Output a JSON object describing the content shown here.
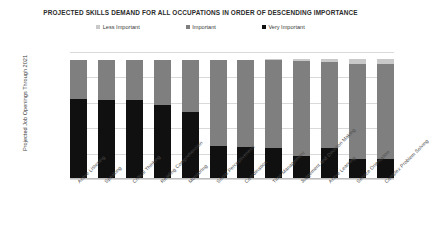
{
  "chart_data": {
    "type": "bar",
    "subtype": "stacked-column",
    "title": "PROJECTED SKILLS DEMAND FOR ALL OCCUPATIONS IN ORDER OF DESCENDING IMPORTANCE",
    "xlabel": "",
    "ylabel": "Projected Job Openings Through 2021",
    "ylim": [
      0,
      2500000
    ],
    "ytick_labels": [
      "2,500,000",
      "2,000,000",
      "1,500,000",
      "1,000,000",
      "500,000",
      "0"
    ],
    "ytick_values": [
      2500000,
      2000000,
      1500000,
      1000000,
      500000,
      0
    ],
    "grid": true,
    "legend_position": "top-center",
    "categories": [
      "Active Listening",
      "Speaking",
      "Critical Thinking",
      "Reading Comprehension",
      "Monitoring",
      "Social Perceptiveness",
      "Coordination",
      "Time Management",
      "Judgement and Decision Making",
      "Active Learning",
      "Service Orientation",
      "Complex Problem Solving"
    ],
    "series": [
      {
        "name": "Very Important",
        "color": "#101010",
        "values": [
          1570000,
          1560000,
          1550000,
          1450000,
          1310000,
          650000,
          640000,
          620000,
          460000,
          610000,
          390000,
          400000
        ]
      },
      {
        "name": "Important",
        "color": "#7f7f7f",
        "values": [
          780000,
          790000,
          800000,
          900000,
          1040000,
          1700000,
          1700000,
          1720000,
          1870000,
          1700000,
          1880000,
          1860000
        ]
      },
      {
        "name": "Less Important",
        "color": "#c9c9c9",
        "values": [
          0,
          0,
          0,
          0,
          0,
          0,
          10000,
          20000,
          30000,
          50000,
          90000,
          100000
        ]
      }
    ],
    "colors": {
      "less_important": "#c9c9c9",
      "important": "#7f7f7f",
      "very_important": "#101010",
      "gridline": "#d9d9d9",
      "text": "#3a3a3a",
      "background": "#ffffff"
    }
  },
  "legend": {
    "items": [
      {
        "label": "Less Important",
        "color": "#c9c9c9"
      },
      {
        "label": "Important",
        "color": "#7f7f7f"
      },
      {
        "label": "Very Important",
        "color": "#101010"
      }
    ]
  }
}
